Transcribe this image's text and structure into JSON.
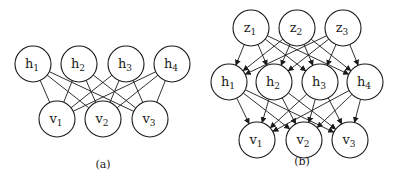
{
  "figure": {
    "colors": {
      "stroke": "#1a1a1a",
      "fill": "#ffffff",
      "background": "#ffffff"
    },
    "node_radius": 18,
    "panels": [
      {
        "id": "a",
        "caption": "(a)",
        "caption_pos": [
          103,
          168
        ],
        "directed": false,
        "layers": [
          {
            "name": "hidden",
            "nodes": [
              {
                "id": "a_h1",
                "base": "h",
                "sub": "1",
                "x": 33,
                "y": 64
              },
              {
                "id": "a_h2",
                "base": "h",
                "sub": "2",
                "x": 79,
                "y": 64
              },
              {
                "id": "a_h3",
                "base": "h",
                "sub": "3",
                "x": 126,
                "y": 64
              },
              {
                "id": "a_h4",
                "base": "h",
                "sub": "4",
                "x": 172,
                "y": 64
              }
            ]
          },
          {
            "name": "visible",
            "nodes": [
              {
                "id": "a_v1",
                "base": "v",
                "sub": "1",
                "x": 57,
                "y": 119
              },
              {
                "id": "a_v2",
                "base": "v",
                "sub": "2",
                "x": 103,
                "y": 119
              },
              {
                "id": "a_v3",
                "base": "v",
                "sub": "3",
                "x": 150,
                "y": 119
              }
            ]
          }
        ],
        "edges": "fully-connected hidden-visible"
      },
      {
        "id": "b",
        "caption": "(b)",
        "caption_pos": [
          302,
          165
        ],
        "directed": true,
        "layers": [
          {
            "name": "latent",
            "nodes": [
              {
                "id": "b_z1",
                "base": "z",
                "sub": "1",
                "x": 251,
                "y": 28
              },
              {
                "id": "b_z2",
                "base": "z",
                "sub": "2",
                "x": 297,
                "y": 28
              },
              {
                "id": "b_z3",
                "base": "z",
                "sub": "3",
                "x": 343,
                "y": 28
              }
            ]
          },
          {
            "name": "hidden",
            "nodes": [
              {
                "id": "b_h1",
                "base": "h",
                "sub": "1",
                "x": 229,
                "y": 82
              },
              {
                "id": "b_h2",
                "base": "h",
                "sub": "2",
                "x": 274,
                "y": 82
              },
              {
                "id": "b_h3",
                "base": "h",
                "sub": "3",
                "x": 320,
                "y": 82
              },
              {
                "id": "b_h4",
                "base": "h",
                "sub": "4",
                "x": 365,
                "y": 82
              }
            ]
          },
          {
            "name": "visible",
            "nodes": [
              {
                "id": "b_v1",
                "base": "v",
                "sub": "1",
                "x": 257,
                "y": 140
              },
              {
                "id": "b_v2",
                "base": "v",
                "sub": "2",
                "x": 304,
                "y": 140
              },
              {
                "id": "b_v3",
                "base": "v",
                "sub": "3",
                "x": 350,
                "y": 140
              }
            ]
          }
        ],
        "edges": "fully-connected latent-hidden, hidden-visible"
      }
    ]
  }
}
